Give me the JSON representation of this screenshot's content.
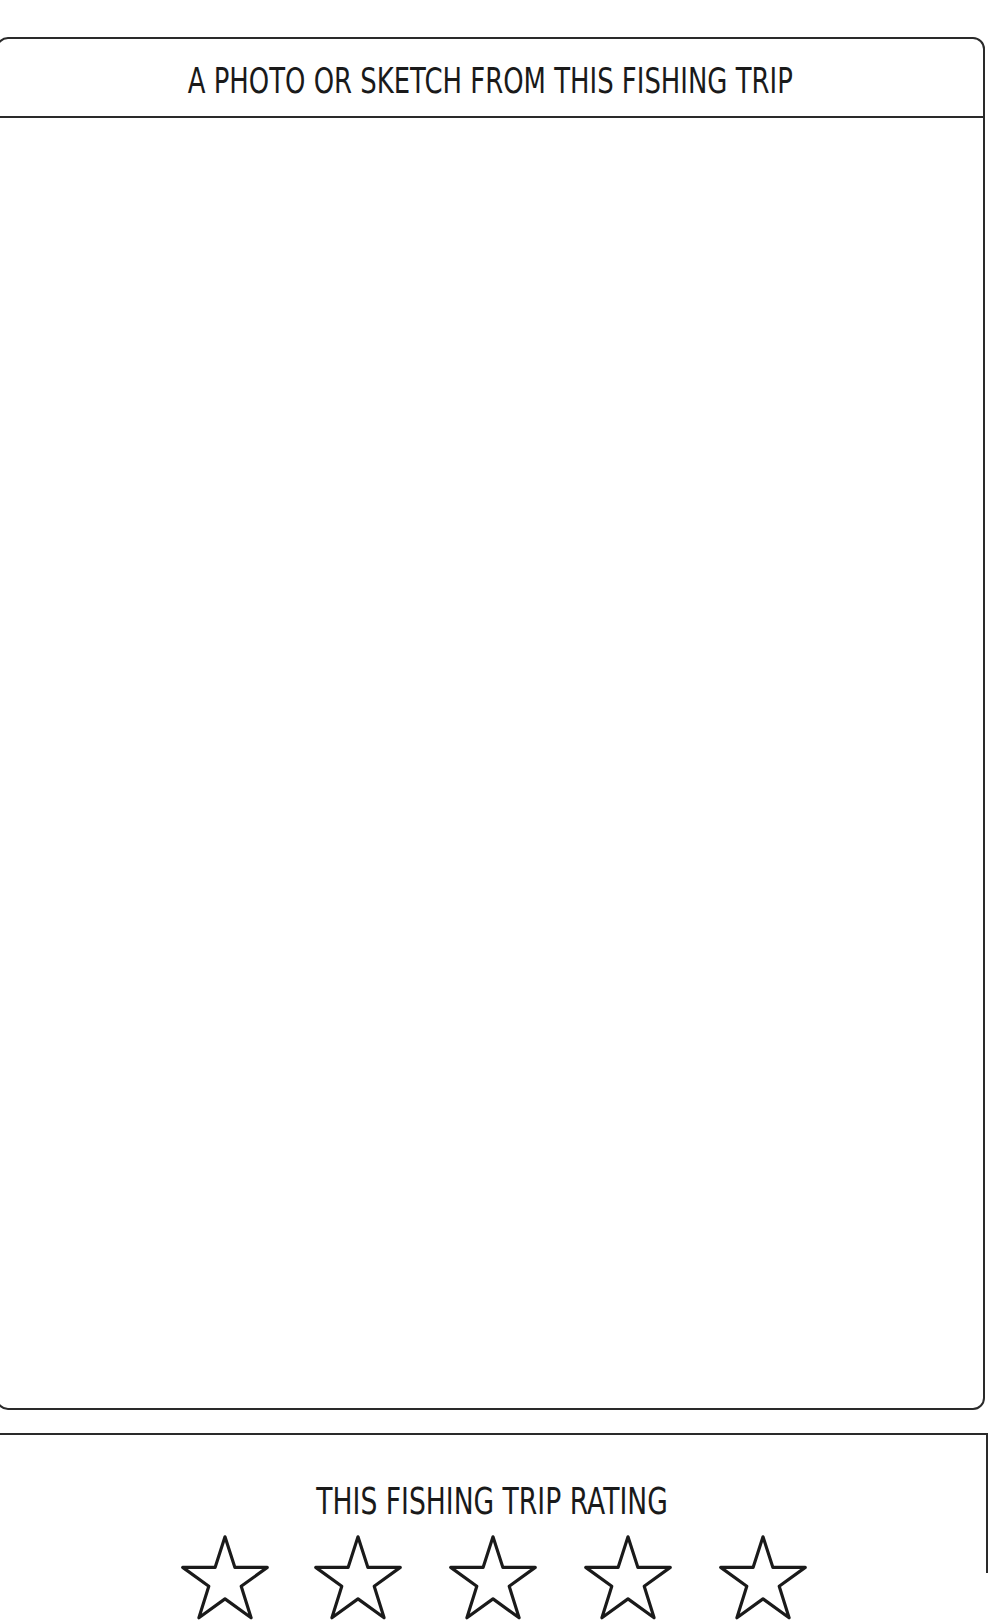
{
  "photo_section": {
    "title": "A PHOTO OR SKETCH FROM THIS FISHING TRIP",
    "content": ""
  },
  "rating_section": {
    "title": "THIS FISHING TRIP RATING",
    "stars": [
      {
        "icon": "star-outline-icon",
        "filled": false
      },
      {
        "icon": "star-outline-icon",
        "filled": false
      },
      {
        "icon": "star-outline-icon",
        "filled": false
      },
      {
        "icon": "star-outline-icon",
        "filled": false
      },
      {
        "icon": "star-outline-icon",
        "filled": false
      }
    ],
    "max_rating": 5
  },
  "colors": {
    "line": "#2a2a2a",
    "text": "#1a1a1a",
    "background": "#ffffff"
  }
}
